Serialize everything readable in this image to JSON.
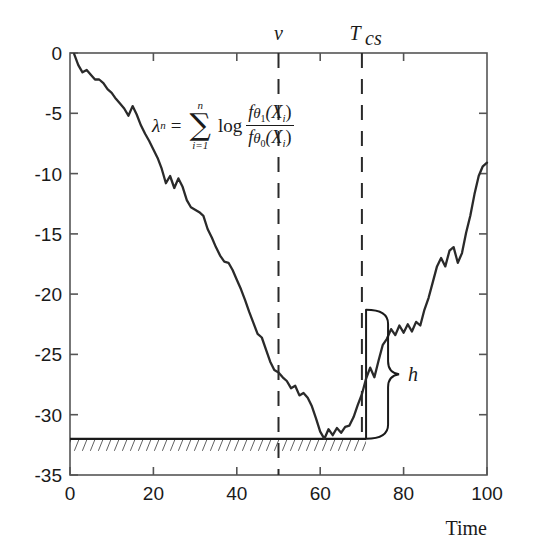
{
  "figure": {
    "title": "",
    "xlabel": "Time",
    "ylabel": "",
    "formula_text": "lambda_n = sum_{i=1}^{n} log ( f_theta1(X_i) / f_theta0(X_i) )",
    "formula_parts": {
      "lhs_symbol": "λ",
      "lhs_sub": "n",
      "equals": "=",
      "sum_upper": "n",
      "sum_symbol": "∑",
      "sum_lower": "i=1",
      "log_word": "log",
      "num_f": "f",
      "num_theta": "θ",
      "num_theta_sub": "1",
      "num_arg": "(X",
      "num_arg_sub": "i",
      "num_close": ")",
      "den_f": "f",
      "den_theta": "θ",
      "den_theta_sub": "0",
      "den_arg": "(X",
      "den_arg_sub": "i",
      "den_close": ")"
    },
    "markers": {
      "nu_label": "ν",
      "nu_value": 50,
      "tcs_label": "T",
      "tcs_sub": "cs",
      "tcs_value": 70,
      "threshold_label": "h",
      "threshold_top": -21.3,
      "threshold_bottom": -32
    },
    "baseline": {
      "value": -32,
      "style": "hatched",
      "x_start": 0,
      "x_end": 71
    },
    "colors": {
      "curve": "#2a2a2a",
      "axis": "#4a4a4a",
      "background": "#ffffff",
      "annotation": "#1a1a1a"
    }
  },
  "chart_data": {
    "type": "line",
    "title": "",
    "xlabel": "Time",
    "ylabel": "",
    "xlim": [
      0,
      100
    ],
    "ylim": [
      -35,
      0
    ],
    "xticks": [
      0,
      20,
      40,
      60,
      80,
      100
    ],
    "xtick_labels": [
      "0",
      "20",
      "40",
      "60",
      "80",
      "100"
    ],
    "yticks": [
      0,
      -5,
      -10,
      -15,
      -20,
      -25,
      -30,
      -35
    ],
    "ytick_labels": [
      "0",
      "-5",
      "-10",
      "-15",
      "-20",
      "-25",
      "-30",
      "-35"
    ],
    "grid": false,
    "legend": null,
    "series": [
      {
        "name": "lambda_n",
        "x": [
          1,
          2,
          3,
          4,
          5,
          6,
          7,
          8,
          9,
          10,
          11,
          12,
          13,
          14,
          15,
          16,
          17,
          18,
          19,
          20,
          21,
          22,
          23,
          24,
          25,
          26,
          27,
          28,
          29,
          30,
          31,
          32,
          33,
          34,
          35,
          36,
          37,
          38,
          39,
          40,
          41,
          42,
          43,
          44,
          45,
          46,
          47,
          48,
          49,
          50,
          51,
          52,
          53,
          54,
          55,
          56,
          57,
          58,
          59,
          60,
          61,
          62,
          63,
          64,
          65,
          66,
          67,
          68,
          69,
          70,
          71,
          72,
          73,
          74,
          75,
          76,
          77,
          78,
          79,
          80,
          81,
          82,
          83,
          84,
          85,
          86,
          87,
          88,
          89,
          90,
          91,
          92,
          93,
          94,
          95,
          96,
          97,
          98,
          99,
          100
        ],
        "y": [
          -0.1,
          -1.0,
          -1.6,
          -1.4,
          -1.8,
          -2.2,
          -2.2,
          -2.5,
          -3.0,
          -3.3,
          -3.8,
          -4.2,
          -4.6,
          -5.2,
          -4.4,
          -5.1,
          -6.0,
          -6.7,
          -7.3,
          -8.0,
          -8.7,
          -9.6,
          -10.8,
          -10.2,
          -11.2,
          -10.4,
          -11.1,
          -12.2,
          -12.8,
          -13.0,
          -13.2,
          -13.5,
          -14.6,
          -15.3,
          -16.1,
          -16.8,
          -17.3,
          -17.4,
          -18.0,
          -18.8,
          -19.6,
          -20.5,
          -21.5,
          -22.4,
          -23.3,
          -23.6,
          -24.6,
          -25.6,
          -26.3,
          -26.5,
          -26.9,
          -27.2,
          -27.8,
          -27.6,
          -28.4,
          -28.2,
          -28.6,
          -29.3,
          -30.3,
          -31.4,
          -32.0,
          -31.2,
          -31.7,
          -31.1,
          -31.5,
          -31.0,
          -30.9,
          -30.2,
          -29.2,
          -28.3,
          -27.0,
          -26.1,
          -26.9,
          -25.5,
          -24.2,
          -23.7,
          -22.9,
          -23.4,
          -22.6,
          -23.2,
          -22.5,
          -23.1,
          -22.3,
          -22.6,
          -21.3,
          -20.3,
          -19.0,
          -17.7,
          -17.0,
          -17.7,
          -16.4,
          -16.1,
          -17.4,
          -16.6,
          -14.9,
          -13.5,
          -11.7,
          -10.2,
          -9.4,
          -9.1
        ]
      }
    ],
    "annotations": [
      {
        "kind": "vline",
        "label": "ν",
        "x": 50,
        "style": "dashed"
      },
      {
        "kind": "vline",
        "label": "T_cs",
        "x": 70,
        "style": "dashed"
      },
      {
        "kind": "vline",
        "label": "",
        "x": 71,
        "style": "solid",
        "y_from": -21.3,
        "y_to": -32
      },
      {
        "kind": "hline-hatched",
        "label": "",
        "y": -32,
        "x_from": 0,
        "x_to": 71
      },
      {
        "kind": "brace",
        "label": "h",
        "x": 75,
        "y_from": -21.3,
        "y_to": -32
      },
      {
        "kind": "text",
        "label": "formula",
        "x": 12,
        "y": -6.5
      }
    ]
  }
}
